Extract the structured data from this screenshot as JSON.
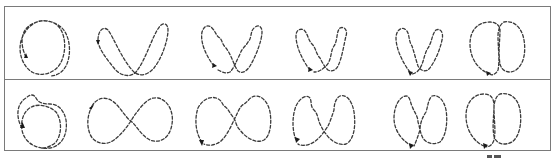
{
  "figure": {
    "rows": 2,
    "columns": 6,
    "line_style": "dashed",
    "line_color": "#3a3a3a",
    "frame_color": "#7a7a7a",
    "background": "#ffffff",
    "panels": [
      {
        "row": 1,
        "col": 1,
        "shape": "double-loop circle",
        "arrow": "up"
      },
      {
        "row": 1,
        "col": 2,
        "shape": "V-shaped figure-eight",
        "arrow": "down"
      },
      {
        "row": 1,
        "col": 3,
        "shape": "V-shaped figure-eight, wavy",
        "arrow": "down-left"
      },
      {
        "row": 1,
        "col": 4,
        "shape": "V-shaped figure-eight, wavy",
        "arrow": "down-left"
      },
      {
        "row": 1,
        "col": 5,
        "shape": "narrow V figure-eight, wavy",
        "arrow": "down"
      },
      {
        "row": 1,
        "col": 6,
        "shape": "two touching ovals",
        "arrow": "down-right"
      },
      {
        "row": 2,
        "col": 1,
        "shape": "double-loop circle",
        "arrow": "up"
      },
      {
        "row": 2,
        "col": 2,
        "shape": "horizontal figure-eight (lemniscate)",
        "arrow": "down-left"
      },
      {
        "row": 2,
        "col": 3,
        "shape": "figure-eight, wavy",
        "arrow": "down-left"
      },
      {
        "row": 2,
        "col": 4,
        "shape": "figure-eight, wavy",
        "arrow": "down-left"
      },
      {
        "row": 2,
        "col": 5,
        "shape": "narrow figure-eight, wavy",
        "arrow": "down"
      },
      {
        "row": 2,
        "col": 6,
        "shape": "two touching ovals",
        "arrow": "down-right"
      }
    ]
  }
}
